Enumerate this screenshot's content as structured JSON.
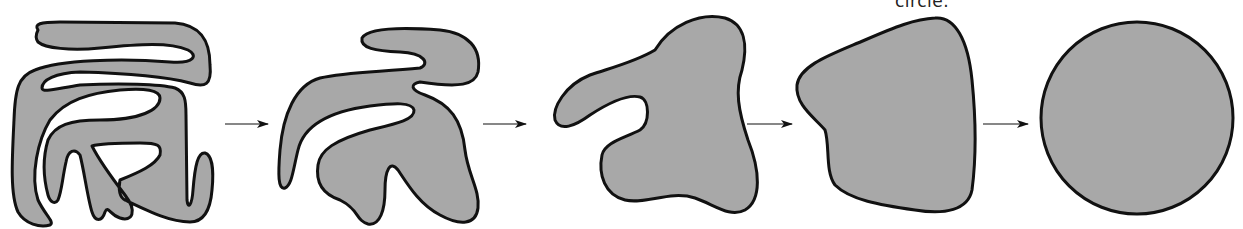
{
  "diagram": {
    "caption_fragment": "circle.",
    "fill_color": "#a8a8a8",
    "stroke_color": "#111111",
    "arrow_color": "#111111",
    "stages": [
      {
        "id": "stage-1",
        "description": "highly convoluted folded blob"
      },
      {
        "id": "stage-2",
        "description": "less convoluted blob"
      },
      {
        "id": "stage-3",
        "description": "blob with one lobe"
      },
      {
        "id": "stage-4",
        "description": "nearly convex rounded shape"
      },
      {
        "id": "stage-5",
        "description": "circle"
      }
    ],
    "arrows": [
      {
        "from": "stage-1",
        "to": "stage-2"
      },
      {
        "from": "stage-2",
        "to": "stage-3"
      },
      {
        "from": "stage-3",
        "to": "stage-4"
      },
      {
        "from": "stage-4",
        "to": "stage-5"
      }
    ]
  }
}
